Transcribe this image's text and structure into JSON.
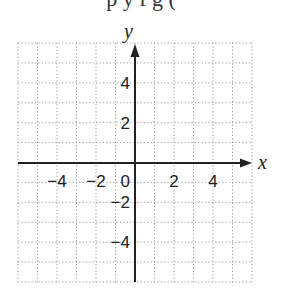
{
  "header": {
    "cutoff_text": "p  y   f       g  ( "
  },
  "chart_data": {
    "type": "line",
    "title": "",
    "xlabel": "x",
    "ylabel": "y",
    "xlim": [
      -6,
      6
    ],
    "ylim": [
      -6,
      6
    ],
    "grid": true,
    "grid_style": "dotted",
    "x_ticks": [
      {
        "value": -4,
        "label": "−4"
      },
      {
        "value": -2,
        "label": "−2"
      },
      {
        "value": 0,
        "label": "0"
      },
      {
        "value": 2,
        "label": "2"
      },
      {
        "value": 4,
        "label": "4"
      }
    ],
    "y_ticks": [
      {
        "value": 4,
        "label": "4"
      },
      {
        "value": 2,
        "label": "2"
      },
      {
        "value": -2,
        "label": "−2"
      },
      {
        "value": -4,
        "label": "−4"
      }
    ],
    "series": []
  },
  "colors": {
    "axis": "#222222",
    "grid": "#9a9a9a",
    "background": "#ffffff"
  }
}
